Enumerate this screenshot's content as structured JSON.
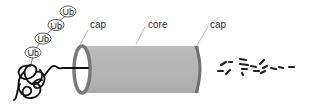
{
  "diagram": {
    "labels": {
      "cap_left": "cap",
      "core": "core",
      "cap_right": "cap"
    },
    "ubiquitin_tags": [
      {
        "label": "Ub"
      },
      {
        "label": "Ub"
      },
      {
        "label": "Ub"
      },
      {
        "label": "Ub"
      }
    ],
    "colors": {
      "core_fill": "#b3b3b3",
      "cap_stroke": "#7a7a7a",
      "protein_stroke": "#111111",
      "label_text": "#333333",
      "leader_line": "#aaaaaa"
    },
    "components": [
      "polyubiquitin-chain",
      "unfolded-substrate-protein",
      "proteasome-cap-left",
      "proteasome-core",
      "proteasome-cap-right",
      "peptide-fragments"
    ]
  }
}
